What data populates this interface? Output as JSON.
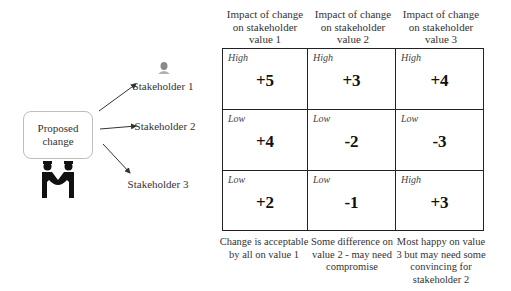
{
  "proposed_change": {
    "label": "Proposed change"
  },
  "stakeholders": [
    {
      "label": "Stakeholder 1"
    },
    {
      "label": "Stakeholder 2"
    },
    {
      "label": "Stakeholder 3"
    }
  ],
  "columns": [
    {
      "header": "Impact of change on stakeholder value 1",
      "caption": "Change is acceptable by all on value 1"
    },
    {
      "header": "Impact of change on stakeholder value 2",
      "caption": "Some difference  on value 2 - may need compromise"
    },
    {
      "header": "Impact of change on stakeholder value 3",
      "caption": "Most happy on value 3 but may need some convincing for stakeholder 2"
    }
  ],
  "grid": [
    [
      {
        "level": "High",
        "value": "+5"
      },
      {
        "level": "High",
        "value": "+3"
      },
      {
        "level": "High",
        "value": "+4"
      }
    ],
    [
      {
        "level": "Low",
        "value": "+4"
      },
      {
        "level": "Low",
        "value": "-2"
      },
      {
        "level": "Low",
        "value": "-3"
      }
    ],
    [
      {
        "level": "Low",
        "value": "+2"
      },
      {
        "level": "Low",
        "value": "-1"
      },
      {
        "level": "High",
        "value": "+3"
      }
    ]
  ],
  "icons": {
    "stakeholder_1": "person-bust-icon",
    "proposed_change": "handshake-icon"
  }
}
